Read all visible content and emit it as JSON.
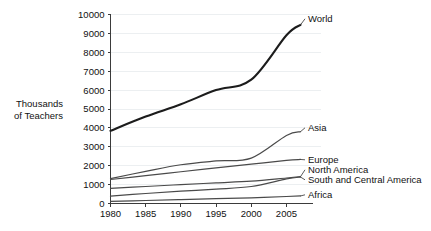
{
  "chart_data": {
    "type": "line",
    "title": "",
    "subtitle": "",
    "xlabel": "",
    "ylabel": "Thousands of Teachers",
    "ylabel_line1": "Thousands",
    "ylabel_line2": "of Teachers",
    "xlim": [
      1980,
      2007
    ],
    "ylim": [
      0,
      10000
    ],
    "grid": true,
    "legend_position": "right-inline-labels",
    "y_ticks": [
      0,
      1000,
      2000,
      3000,
      4000,
      5000,
      6000,
      7000,
      8000,
      9000,
      10000
    ],
    "y_tick_labels": [
      "0",
      "1000",
      "2000",
      "3000",
      "4000",
      "5000",
      "6000",
      "7000",
      "8000",
      "9000",
      "10000"
    ],
    "x_ticks": [
      1980,
      1985,
      1990,
      1995,
      2000,
      2005
    ],
    "x_tick_labels": [
      "1980",
      "1985",
      "1990",
      "1995",
      "2000",
      "2005"
    ],
    "x": [
      1980,
      1985,
      1990,
      1995,
      2000,
      2005,
      2007
    ],
    "series": [
      {
        "name": "World",
        "label": "World",
        "color": "#1c1c1c",
        "width": 2.1,
        "values": [
          3850,
          4600,
          5250,
          6000,
          6550,
          8900,
          9450
        ],
        "label_x": 2007,
        "label_y": 9450
      },
      {
        "name": "Asia",
        "label": "Asia",
        "color": "#4a4a4a",
        "width": 1.2,
        "values": [
          1320,
          1700,
          2050,
          2250,
          2400,
          3600,
          3800
        ],
        "label_x": 2007,
        "label_y": 3800
      },
      {
        "name": "Europe",
        "label": "Europe",
        "color": "#4a4a4a",
        "width": 1.2,
        "values": [
          1270,
          1470,
          1680,
          1880,
          2080,
          2280,
          2330
        ],
        "label_x": 2007,
        "label_y": 2330
      },
      {
        "name": "North America",
        "label": "North America",
        "color": "#4a4a4a",
        "width": 1.2,
        "values": [
          800,
          900,
          1000,
          1090,
          1180,
          1350,
          1420
        ],
        "label_x": 2007,
        "label_y": 1420
      },
      {
        "name": "South and Central America",
        "label": "South and Central America",
        "color": "#4a4a4a",
        "width": 1.2,
        "values": [
          390,
          530,
          650,
          760,
          900,
          1300,
          1400
        ],
        "label_x": 2007,
        "label_y": 1400
      },
      {
        "name": "Africa",
        "label": "Africa",
        "color": "#4a4a4a",
        "width": 1.2,
        "values": [
          110,
          160,
          210,
          255,
          300,
          370,
          400
        ],
        "label_x": 2007,
        "label_y": 400
      }
    ]
  }
}
